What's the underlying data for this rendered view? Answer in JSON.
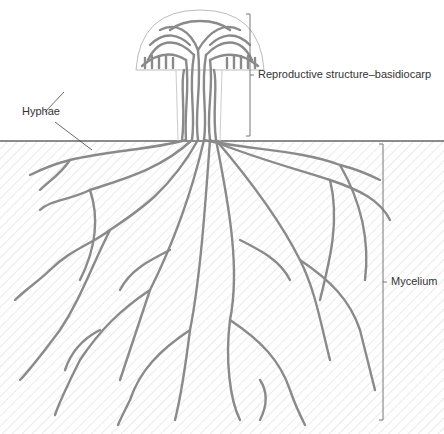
{
  "labels": {
    "hyphae": "Hyphae",
    "basidiocarp": "Reproductive structure–basidiocarp",
    "mycelium": "Mycelium"
  },
  "colors": {
    "hypha_stroke": "#888888",
    "soil_hatch": "#dcdcdc",
    "ground_line": "#666666",
    "bracket": "#777777"
  }
}
